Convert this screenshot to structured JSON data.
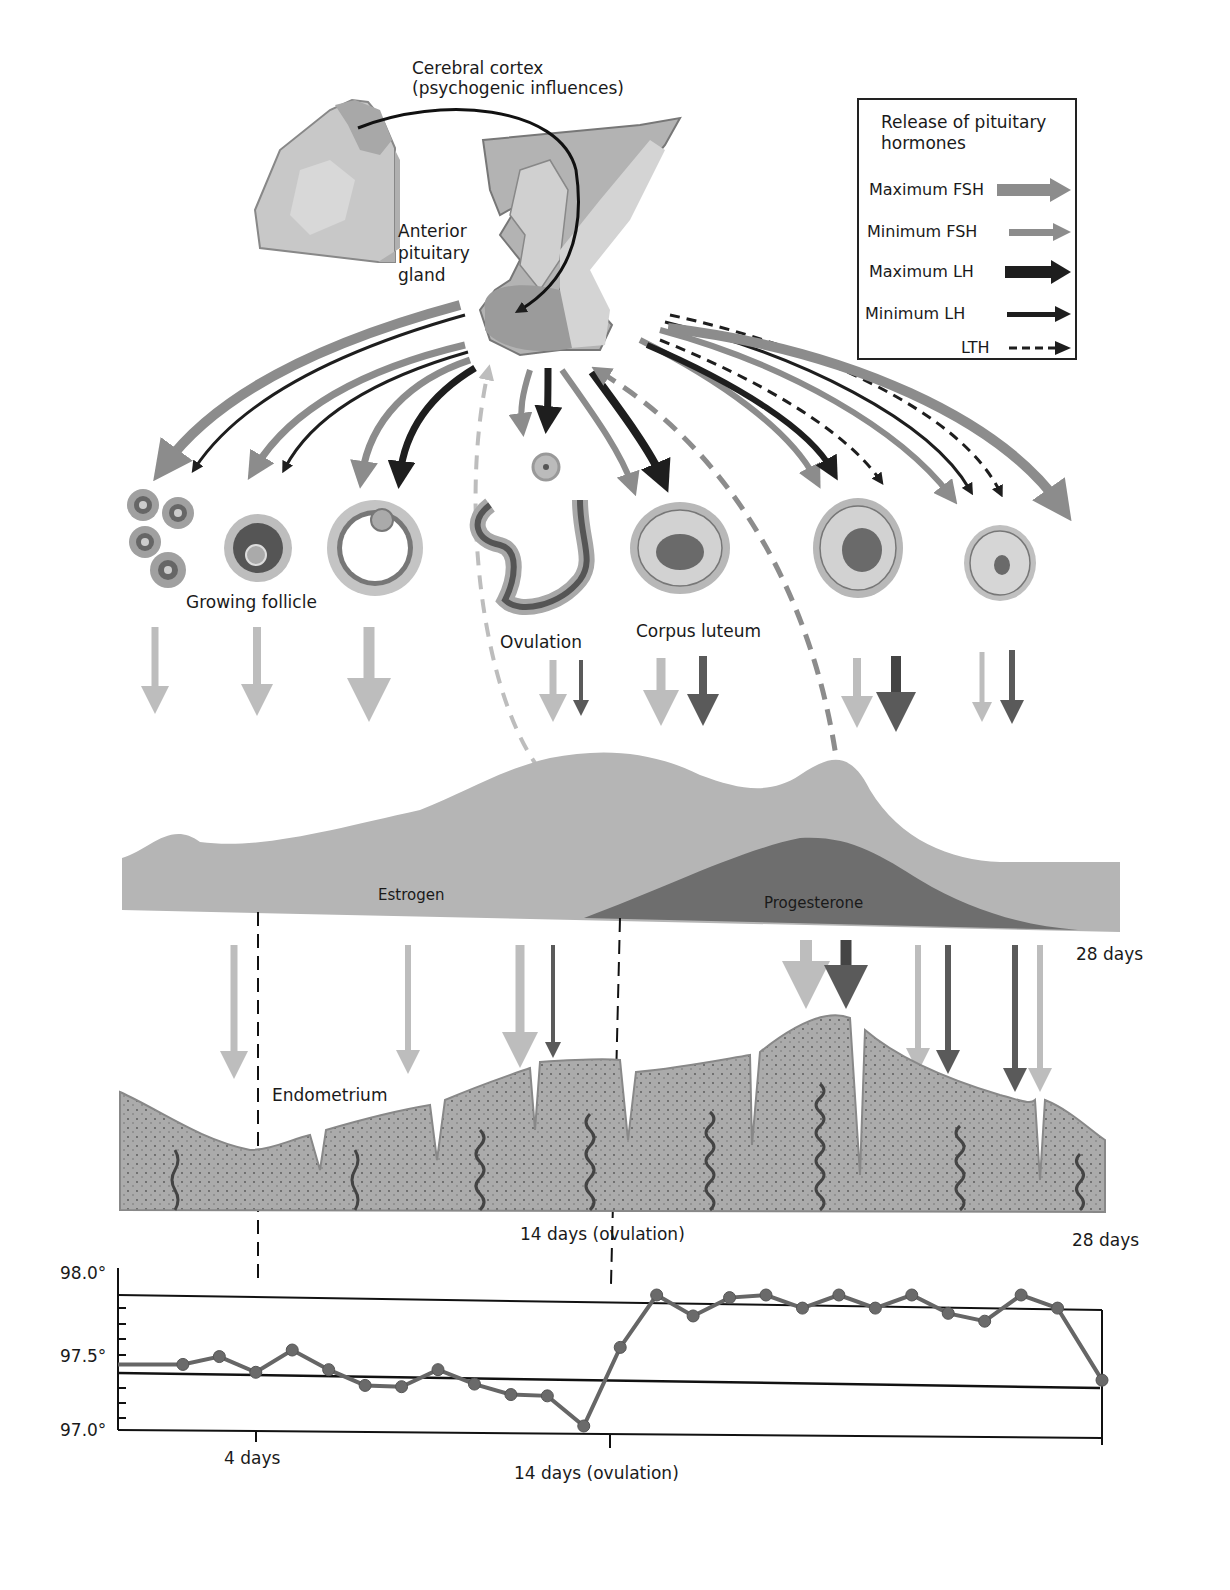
{
  "labels": {
    "cortex_line1": "Cerebral cortex",
    "cortex_line2": "(psychogenic influences)",
    "pituitary_line1": "Anterior",
    "pituitary_line2": "pituitary",
    "pituitary_line3": "gland",
    "growing_follicle": "Growing follicle",
    "ovulation": "Ovulation",
    "corpus_luteum": "Corpus luteum",
    "estrogen": "Estrogen",
    "progesterone": "Progesterone",
    "days28_top": "28 days",
    "endometrium": "Endometrium",
    "ovulation_14": "14 days (ovulation)",
    "days28_mid": "28 days"
  },
  "legend": {
    "title_line1": "Release of pituitary",
    "title_line2": "hormones",
    "items": [
      {
        "label": "Maximum FSH",
        "style": "thick-gray"
      },
      {
        "label": "Minimum FSH",
        "style": "thin-gray"
      },
      {
        "label": "Maximum LH",
        "style": "thick-black"
      },
      {
        "label": "Minimum LH",
        "style": "thin-black"
      },
      {
        "label": "LTH",
        "style": "dashed-black"
      }
    ]
  },
  "colors": {
    "fsh_gray": "#8c8c8c",
    "lh_black": "#1e1e1e",
    "estrogen_fill": "#b5b5b5",
    "progesterone_fill": "#6e6e6e",
    "endometrium_fill": "#a9a9a9",
    "light_arrow": "#bdbdbd",
    "dark_arrow": "#5a5a5a"
  },
  "chart_data": {
    "type": "line",
    "xlabel": "",
    "ylabel": "Temperature (°F)",
    "ylim": [
      97.0,
      98.0
    ],
    "yticks": [
      "98.0°",
      "97.5°",
      "97.0°"
    ],
    "xtick_labels": [
      "4 days",
      "14 days (ovulation)"
    ],
    "reference_line": 97.5,
    "grid": false,
    "x": [
      1,
      3,
      4,
      5,
      6,
      7,
      8,
      9,
      10,
      11,
      12,
      13,
      14,
      15,
      16,
      17,
      18,
      19,
      20,
      21,
      22,
      23,
      24,
      25,
      26,
      27,
      28
    ],
    "values": [
      97.47,
      97.47,
      97.53,
      97.41,
      97.58,
      97.43,
      97.31,
      97.3,
      97.43,
      97.32,
      97.24,
      97.23,
      97.0,
      97.6,
      98.0,
      97.84,
      97.98,
      98.0,
      97.9,
      98.0,
      97.9,
      98.0,
      97.86,
      97.8,
      98.0,
      97.9,
      97.35
    ]
  }
}
